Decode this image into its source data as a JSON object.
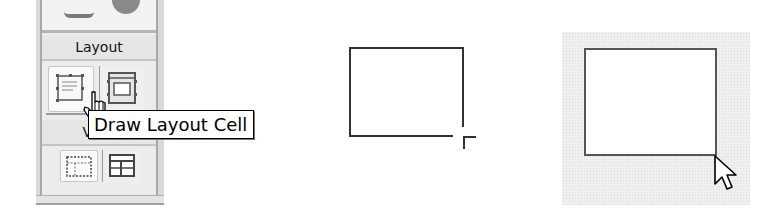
{
  "insert_panel": {
    "sections": [
      {
        "header": "Layout",
        "tools": [
          {
            "name": "draw-layout-cell",
            "icon": "layout-cell-icon",
            "state": "pressed"
          },
          {
            "name": "draw-layout-table",
            "icon": "layout-table-icon",
            "state": "normal"
          }
        ]
      },
      {
        "header": "View",
        "tools": [
          {
            "name": "standard-view",
            "icon": "standard-view-icon",
            "state": "normal"
          },
          {
            "name": "layout-view",
            "icon": "layout-view-icon",
            "state": "normal"
          }
        ]
      }
    ]
  },
  "tooltip": {
    "text": "Draw Layout Cell"
  },
  "cursors": {
    "hover": "hand-pointer-icon",
    "drawing": "crosshair-icon",
    "finished": "arrow-pointer-icon"
  },
  "colors": {
    "panel_bg": "#ececec",
    "panel_border": "#a8a8a8",
    "rect_stroke": "#333333",
    "cell_area_bg": "#efefef"
  }
}
